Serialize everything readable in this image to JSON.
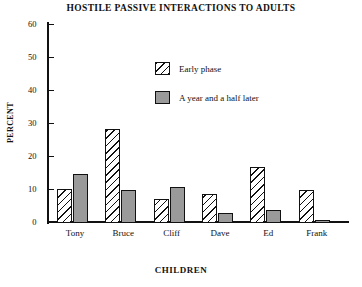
{
  "chart_data": {
    "type": "bar",
    "title": "HOSTILE PASSIVE INTERACTIONS TO ADULTS",
    "xlabel": "CHILDREN",
    "ylabel": "PERCENT",
    "categories": [
      "Tony",
      "Bruce",
      "Cliff",
      "Dave",
      "Ed",
      "Frank"
    ],
    "series": [
      {
        "name": "Early phase",
        "pattern": "hatched",
        "values": [
          10,
          28,
          7,
          8.5,
          16.5,
          9.5
        ]
      },
      {
        "name": "A year and a half later",
        "pattern": "solid-gray",
        "values": [
          14.5,
          9.5,
          10.5,
          2.5,
          3.5,
          0.5
        ]
      }
    ],
    "ylim": [
      0,
      60
    ],
    "ytick_values": [
      60,
      50,
      40,
      30,
      20,
      10,
      0
    ],
    "ytick_labels": [
      "60",
      "50",
      "40",
      "30",
      "20",
      "10",
      "0"
    ],
    "grid": false,
    "legend_position": "upper-center"
  },
  "legend": {
    "items": [
      {
        "label": "Early phase"
      },
      {
        "label": "A year and a half later"
      }
    ]
  },
  "colors": {
    "axis": "#111111",
    "later_fill": "#9a9a9a",
    "early_fill": "#ffffff",
    "background": "#ffffff"
  },
  "caption": {
    "text": ""
  }
}
